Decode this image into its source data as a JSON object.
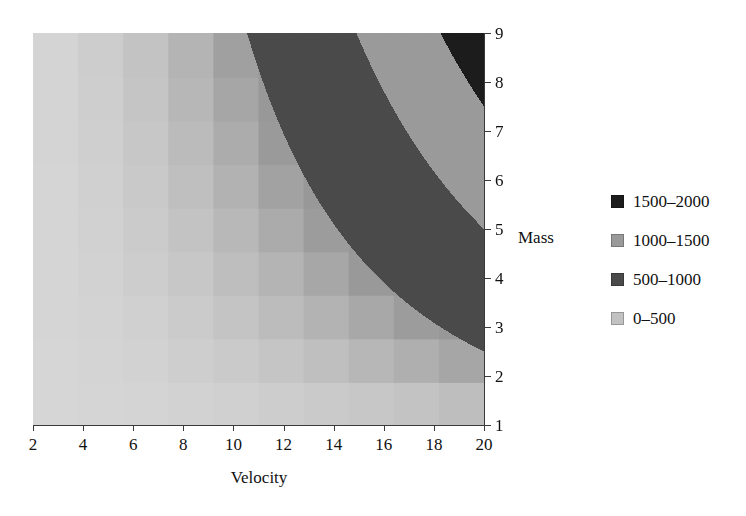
{
  "chart_data": {
    "type": "heatmap",
    "title": "",
    "subtitle": "",
    "xlabel": "Velocity",
    "ylabel": "Mass",
    "xlim": [
      2,
      20
    ],
    "ylim": [
      1,
      9
    ],
    "grid": false,
    "legend_position": "right",
    "x_ticks": [
      "2",
      "4",
      "6",
      "8",
      "10",
      "12",
      "14",
      "16",
      "18",
      "20"
    ],
    "x_tick_values": [
      2,
      4,
      6,
      8,
      10,
      12,
      14,
      16,
      18,
      20
    ],
    "y_ticks": [
      "1",
      "2",
      "3",
      "4",
      "5",
      "6",
      "7",
      "8",
      "9"
    ],
    "y_tick_values": [
      1,
      2,
      3,
      4,
      5,
      6,
      7,
      8,
      9
    ],
    "y_axis_side": "right",
    "value_formula": "0.5 * mass * velocity^2",
    "value_label": "Kinetic Energy",
    "zlim": [
      0,
      2000
    ],
    "contour_levels": [
      0,
      500,
      1000,
      1500,
      2000
    ],
    "legend": [
      {
        "label": "1500–2000",
        "color": "#1c1c1c",
        "min": 1500,
        "max": 2000
      },
      {
        "label": "1000–1500",
        "color": "#9a9a9a",
        "min": 1000,
        "max": 1500
      },
      {
        "label": "500–1000",
        "color": "#4a4a4a",
        "min": 500,
        "max": 1000
      },
      {
        "label": "0–500",
        "color": "#c2c2c2",
        "min": 0,
        "max": 500
      }
    ],
    "x_cells": [
      2,
      4,
      6,
      8,
      10,
      12,
      14,
      16,
      18,
      20
    ],
    "y_cells": [
      1,
      2,
      3,
      4,
      5,
      6,
      7,
      8,
      9
    ],
    "cell_values": [
      [
        2,
        4,
        6,
        8,
        10,
        12,
        14,
        16,
        18,
        20
      ],
      [
        4,
        16,
        36,
        64,
        100,
        144,
        196,
        256,
        324,
        400
      ],
      [
        8,
        32,
        72,
        128,
        200,
        288,
        392,
        512,
        648,
        800
      ],
      [
        12,
        48,
        108,
        192,
        300,
        432,
        588,
        768,
        972,
        1200
      ],
      [
        16,
        64,
        144,
        256,
        400,
        576,
        784,
        1024,
        1296,
        1600
      ],
      [
        20,
        80,
        180,
        320,
        500,
        720,
        980,
        1280,
        1620,
        2000
      ],
      [
        24,
        96,
        216,
        384,
        600,
        864,
        1176,
        1536,
        1944,
        2400
      ],
      [
        28,
        112,
        252,
        448,
        700,
        1008,
        1372,
        1792,
        2268,
        2800
      ],
      [
        32,
        128,
        288,
        512,
        800,
        1152,
        1568,
        2048,
        2592,
        3200
      ],
      [
        36,
        144,
        324,
        576,
        900,
        1296,
        1764,
        2304,
        2916,
        3600
      ]
    ]
  },
  "axes": {
    "x_title": "Velocity",
    "y_title": "Mass"
  }
}
